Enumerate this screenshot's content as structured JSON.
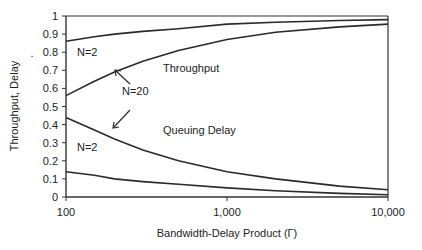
{
  "chart_data": {
    "type": "line",
    "title": "",
    "xlabel": "Bandwidth-Delay Product (Γ)",
    "ylabel": "Throughput, Delay",
    "xscale": "log",
    "xlim": [
      100,
      10000
    ],
    "ylim": [
      0,
      1
    ],
    "xticks": [
      100,
      1000,
      10000
    ],
    "xtick_labels": [
      "100",
      "1,000",
      "10,000"
    ],
    "yticks": [
      0,
      0.1,
      0.2,
      0.3,
      0.4,
      0.5,
      0.6,
      0.7,
      0.8,
      0.9,
      1
    ],
    "ytick_labels": [
      "0",
      "0.1",
      "0.2",
      "0.3",
      "0.4",
      "0.5",
      "0.6",
      "0.7",
      "0.8",
      "0.9",
      "1"
    ],
    "grid": false,
    "legend": "none",
    "series": [
      {
        "name": "Throughput N=2",
        "x": [
          100,
          150,
          200,
          300,
          500,
          1000,
          2000,
          5000,
          10000
        ],
        "y": [
          0.86,
          0.885,
          0.9,
          0.915,
          0.93,
          0.955,
          0.965,
          0.975,
          0.98
        ]
      },
      {
        "name": "Throughput N=20",
        "x": [
          100,
          150,
          200,
          300,
          500,
          1000,
          2000,
          5000,
          10000
        ],
        "y": [
          0.56,
          0.64,
          0.69,
          0.75,
          0.81,
          0.87,
          0.91,
          0.94,
          0.955
        ]
      },
      {
        "name": "Queuing Delay N=20",
        "x": [
          100,
          150,
          200,
          300,
          500,
          1000,
          2000,
          5000,
          10000
        ],
        "y": [
          0.44,
          0.37,
          0.32,
          0.26,
          0.2,
          0.14,
          0.1,
          0.06,
          0.04
        ]
      },
      {
        "name": "Queuing Delay N=2",
        "x": [
          100,
          150,
          200,
          300,
          500,
          1000,
          2000,
          5000,
          10000
        ],
        "y": [
          0.14,
          0.12,
          0.1,
          0.085,
          0.07,
          0.05,
          0.035,
          0.02,
          0.012
        ]
      }
    ],
    "annotations": [
      {
        "text": "N=2",
        "target": "Throughput N=2"
      },
      {
        "text": "Throughput"
      },
      {
        "text": "N=20",
        "arrows_to": [
          "Throughput N=20",
          "Queuing Delay N=20"
        ]
      },
      {
        "text": "Queuing Delay"
      },
      {
        "text": "N=2",
        "target": "Queuing Delay N=2"
      }
    ],
    "stray_mark": "."
  }
}
